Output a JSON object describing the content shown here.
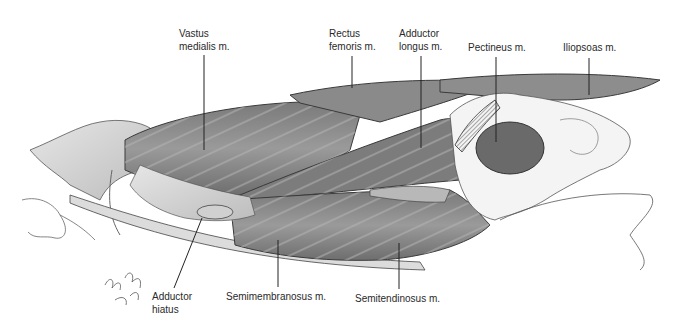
{
  "figure": {
    "background_color": "#ffffff",
    "muscle_fill": "#8c8c8c",
    "muscle_dark": "#5e5e5e",
    "outline_color": "#3a3a3a",
    "signature": "gary wind"
  },
  "labels": [
    {
      "id": "vastus-medialis",
      "text": "Vastus\nmedialis m."
    },
    {
      "id": "rectus-femoris",
      "text": "Rectus\nfemoris m."
    },
    {
      "id": "adductor-longus",
      "text": "Adductor\nlongus m."
    },
    {
      "id": "pectineus",
      "text": "Pectineus m."
    },
    {
      "id": "iliopsoas",
      "text": "Iliopsoas m."
    },
    {
      "id": "adductor-hiatus",
      "text": "Adductor\nhiatus"
    },
    {
      "id": "semimembranosus",
      "text": "Semimembranosus m."
    },
    {
      "id": "semitendinosus",
      "text": "Semitendinosus m."
    }
  ]
}
